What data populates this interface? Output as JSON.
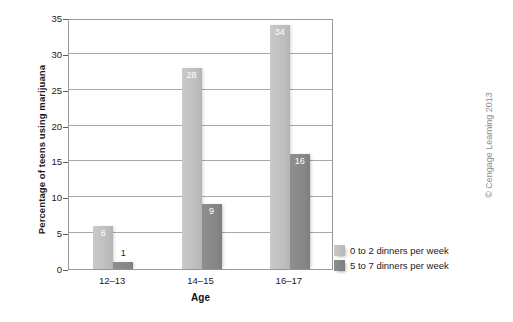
{
  "credit": "© Cengage Learning 2013",
  "chart_data": {
    "type": "bar",
    "title": "",
    "xlabel": "Age",
    "ylabel": "Percentage of teens using marijuana",
    "categories": [
      "12–13",
      "14–15",
      "16–17"
    ],
    "series": [
      {
        "name": "0 to 2 dinners per week",
        "color": "#c2c2c2",
        "values": [
          6,
          28,
          34
        ],
        "labels": [
          "6",
          "28",
          "34"
        ],
        "label_inside": [
          true,
          true,
          true
        ]
      },
      {
        "name": "5 to 7 dinners per week",
        "color": "#868686",
        "values": [
          1,
          9,
          16
        ],
        "labels": [
          "1",
          "9",
          "16"
        ],
        "label_inside": [
          false,
          true,
          true
        ]
      }
    ],
    "ylim": [
      0,
      35
    ],
    "yticks": [
      0,
      5,
      10,
      15,
      20,
      25,
      30,
      35
    ],
    "ytick_labels": [
      "0",
      "5",
      "10",
      "15",
      "20",
      "25",
      "30",
      "35"
    ],
    "grid": true,
    "legend_position": "right-bottom"
  }
}
